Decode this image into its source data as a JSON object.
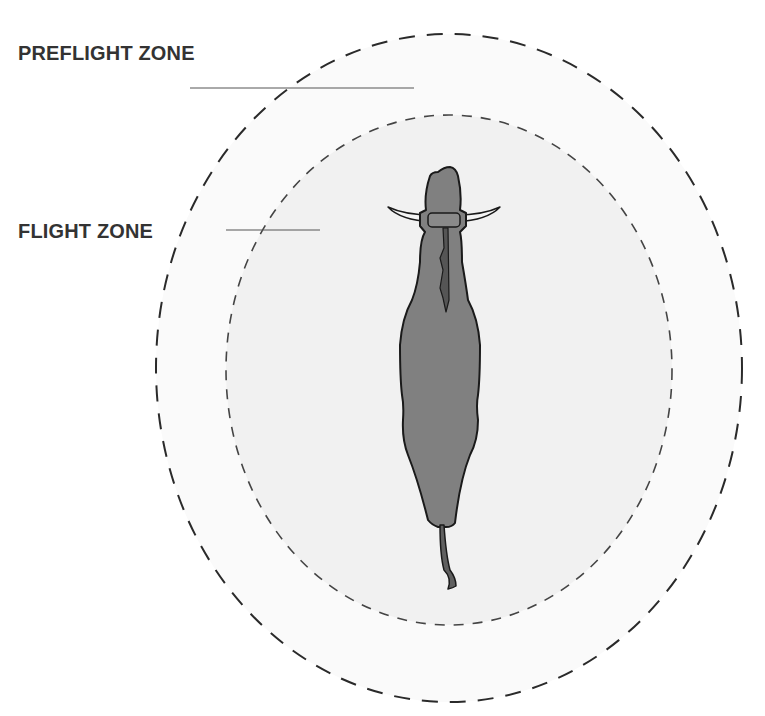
{
  "diagram": {
    "labels": {
      "preflight_zone": "PREFLIGHT ZONE",
      "flight_zone": "FLIGHT ZONE"
    },
    "zones": [
      {
        "name": "preflight-zone",
        "shape": "dashed ellipse",
        "fill": "#fafafa",
        "stroke": "#2a2a2a"
      },
      {
        "name": "flight-zone",
        "shape": "dashed ellipse",
        "fill": "#f1f1f1",
        "stroke": "#444444"
      }
    ],
    "animal": {
      "name": "cow",
      "view": "top-down",
      "fill": "#808080",
      "outline": "#1a1a1a",
      "horn_color": "#f4f4f4"
    }
  }
}
